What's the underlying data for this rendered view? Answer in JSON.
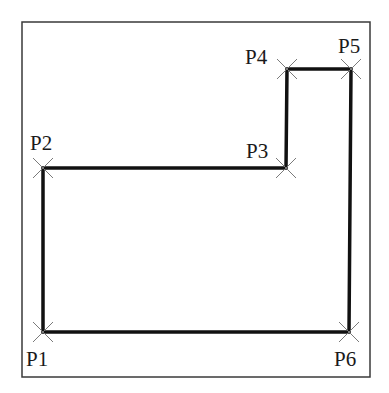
{
  "diagram": {
    "type": "polyline-points",
    "frame": {
      "x": 22,
      "y": 22,
      "width": 348,
      "height": 355
    },
    "colors": {
      "frame": "#3a3a3a",
      "path": "#111111",
      "marker": "#7a7a7a",
      "label": "#1a1a1a"
    },
    "points": [
      {
        "label": "P1",
        "x": 43,
        "y": 332,
        "lx": 26,
        "ly": 366
      },
      {
        "label": "P2",
        "x": 43,
        "y": 168,
        "lx": 30,
        "ly": 150
      },
      {
        "label": "P3",
        "x": 286,
        "y": 168,
        "lx": 246,
        "ly": 158
      },
      {
        "label": "P4",
        "x": 287,
        "y": 69,
        "lx": 245,
        "ly": 64
      },
      {
        "label": "P5",
        "x": 351,
        "y": 69,
        "lx": 338,
        "ly": 53
      },
      {
        "label": "P6",
        "x": 349,
        "y": 332,
        "lx": 334,
        "ly": 366
      }
    ]
  }
}
